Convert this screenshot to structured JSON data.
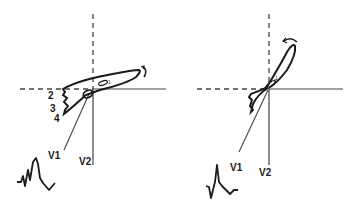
{
  "figure": {
    "colors": {
      "stroke": "#1a1a1a",
      "axis": "#333333",
      "background": "#ffffff"
    }
  },
  "left_panel": {
    "loop_labels": [
      "1",
      "2",
      "3",
      "4"
    ],
    "lead_labels": {
      "v1": "V1",
      "v2": "V2"
    },
    "rotation_arrow": "clockwise-arrow",
    "ecg_complex": "rsR-prime wide complex"
  },
  "right_panel": {
    "loop_labels": [
      "1"
    ],
    "lead_labels": {
      "v1": "V1",
      "v2": "V2"
    },
    "rotation_arrow": "counterclockwise-arrow",
    "ecg_complex": "QR complex"
  }
}
